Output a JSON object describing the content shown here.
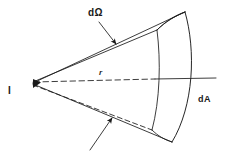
{
  "figure": {
    "background_color": "#ffffff",
    "ink_color": "#1a1a1a",
    "width": 225,
    "height": 152,
    "labels": {
      "source": "I",
      "solid_angle": "dΩ",
      "radius": "r",
      "area_element": "dA"
    },
    "label_meanings": {
      "source": "point source intensity",
      "solid_angle": "differential solid angle",
      "radius": "distance from source to surface",
      "area_element": "differential area on the spherical cap"
    },
    "geometry": {
      "apex": [
        33,
        82
      ],
      "axis_line": {
        "dashed_from": [
          33,
          82
        ],
        "dashed_to": [
          155,
          79
        ],
        "solid_from": [
          155,
          79
        ],
        "solid_to": [
          216,
          78
        ]
      },
      "patch_front_top": [
        185,
        12
      ],
      "patch_front_bottom": [
        172,
        142
      ],
      "patch_back_top": [
        157,
        30
      ],
      "patch_back_bottom": [
        152,
        130
      ]
    },
    "arrows": [
      {
        "name": "solid-angle-arrow",
        "from": [
          99,
          22
        ],
        "to": [
          116,
          44
        ]
      },
      {
        "name": "lower-edge-arrow",
        "from": [
          90,
          148
        ],
        "to": [
          112,
          117
        ]
      }
    ]
  }
}
